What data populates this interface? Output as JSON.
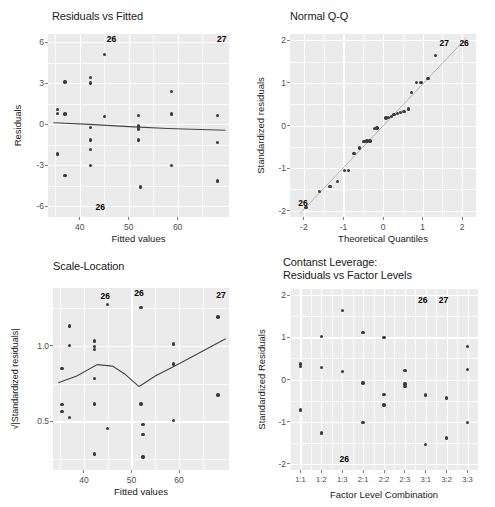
{
  "figure": {
    "background_color": "#ffffff",
    "panel_fill": "#ebebeb",
    "grid_color": "#ffffff",
    "point_color": "#3a3a3a",
    "width": 495,
    "height": 507
  },
  "chart_data": [
    {
      "id": "residuals-vs-fitted",
      "type": "scatter",
      "title": "Residuals vs Fitted",
      "xlabel": "Fitted values",
      "ylabel": "Residuals",
      "xlim": [
        33.5,
        70.5
      ],
      "ylim": [
        -6.8,
        6.6
      ],
      "xticks": [
        40,
        50,
        60
      ],
      "xtick_labels": [
        "40",
        "50",
        "60"
      ],
      "yticks": [
        -6,
        -3,
        0,
        3,
        6
      ],
      "ytick_labels": [
        "-6",
        "-3",
        "0",
        "3",
        "6"
      ],
      "grid": true,
      "legend": "none",
      "points": [
        {
          "x": 35.4,
          "y": 1.05
        },
        {
          "x": 35.4,
          "y": 0.8
        },
        {
          "x": 35.4,
          "y": -2.2
        },
        {
          "x": 37.0,
          "y": 3.1
        },
        {
          "x": 37.0,
          "y": 0.75
        },
        {
          "x": 37.0,
          "y": -3.75
        },
        {
          "x": 42.2,
          "y": 3.4
        },
        {
          "x": 42.2,
          "y": 3.0
        },
        {
          "x": 42.2,
          "y": -0.25
        },
        {
          "x": 42.2,
          "y": -1.15
        },
        {
          "x": 42.2,
          "y": -1.85
        },
        {
          "x": 42.2,
          "y": -3.05
        },
        {
          "x": 45.0,
          "y": 5.1
        },
        {
          "x": 45.0,
          "y": 0.55
        },
        {
          "x": 52.0,
          "y": 0.65
        },
        {
          "x": 52.0,
          "y": -0.15
        },
        {
          "x": 52.0,
          "y": -0.35
        },
        {
          "x": 52.0,
          "y": -1.15
        },
        {
          "x": 52.4,
          "y": -4.6
        },
        {
          "x": 58.8,
          "y": 2.4
        },
        {
          "x": 58.8,
          "y": 0.75
        },
        {
          "x": 58.8,
          "y": -3.05
        },
        {
          "x": 68.2,
          "y": 0.65
        },
        {
          "x": 68.2,
          "y": -1.35
        },
        {
          "x": 68.2,
          "y": -4.15
        }
      ],
      "trend": {
        "kind": "loess",
        "points": [
          {
            "x": 34.6,
            "y": 0.1
          },
          {
            "x": 42.0,
            "y": -0.02
          },
          {
            "x": 50.0,
            "y": -0.18
          },
          {
            "x": 58.0,
            "y": -0.32
          },
          {
            "x": 69.8,
            "y": -0.45
          }
        ]
      },
      "annotations": [
        {
          "label": "26",
          "x": 46.5,
          "y": 6.25
        },
        {
          "label": "27",
          "x": 69.0,
          "y": 6.25
        },
        {
          "label": "26",
          "x": 44.2,
          "y": -6.1
        }
      ]
    },
    {
      "id": "normal-qq",
      "type": "scatter",
      "title": "Normal Q-Q",
      "xlabel": "Theoretical Quantiles",
      "ylabel": "Standardized residuals",
      "xlim": [
        -2.35,
        2.35
      ],
      "ylim": [
        -2.15,
        2.15
      ],
      "xticks": [
        -2,
        -1,
        0,
        1,
        2
      ],
      "xtick_labels": [
        "-2",
        "-1",
        "0",
        "1",
        "2"
      ],
      "yticks": [
        -2,
        -1,
        0,
        1,
        2
      ],
      "ytick_labels": [
        "-2",
        "-1",
        "0",
        "1",
        "2"
      ],
      "grid": true,
      "legend": "none",
      "points": [
        {
          "x": -1.95,
          "y": -1.92
        },
        {
          "x": -1.6,
          "y": -1.55
        },
        {
          "x": -1.34,
          "y": -1.43
        },
        {
          "x": -1.15,
          "y": -1.31
        },
        {
          "x": -0.97,
          "y": -1.06
        },
        {
          "x": -0.87,
          "y": -1.06
        },
        {
          "x": -0.73,
          "y": -0.66
        },
        {
          "x": -0.6,
          "y": -0.53
        },
        {
          "x": -0.48,
          "y": -0.38
        },
        {
          "x": -0.4,
          "y": -0.36
        },
        {
          "x": -0.33,
          "y": -0.36
        },
        {
          "x": -0.22,
          "y": -0.07
        },
        {
          "x": -0.15,
          "y": -0.06
        },
        {
          "x": 0.08,
          "y": 0.18
        },
        {
          "x": 0.14,
          "y": 0.19
        },
        {
          "x": 0.21,
          "y": 0.21
        },
        {
          "x": 0.28,
          "y": 0.26
        },
        {
          "x": 0.36,
          "y": 0.28
        },
        {
          "x": 0.44,
          "y": 0.31
        },
        {
          "x": 0.53,
          "y": 0.33
        },
        {
          "x": 0.64,
          "y": 0.39
        },
        {
          "x": 0.72,
          "y": 0.78
        },
        {
          "x": 0.84,
          "y": 1.01
        },
        {
          "x": 0.96,
          "y": 1.01
        },
        {
          "x": 1.14,
          "y": 1.1
        },
        {
          "x": 1.33,
          "y": 1.65
        }
      ],
      "trend": {
        "kind": "qq-reference",
        "points": [
          {
            "x": -2.1,
            "y": -2.07
          },
          {
            "x": 2.1,
            "y": 2.05
          }
        ]
      },
      "annotations": [
        {
          "label": "26",
          "x": -2.02,
          "y": -1.82
        },
        {
          "label": "27",
          "x": 1.55,
          "y": 1.93
        },
        {
          "label": "26",
          "x": 2.05,
          "y": 1.95
        }
      ]
    },
    {
      "id": "scale-location",
      "type": "scatter",
      "title": "Scale-Location",
      "xlabel": "Fitted values",
      "ylabel": "√|Standardized residuals|",
      "xlim": [
        33.5,
        70.5
      ],
      "ylim": [
        0.18,
        1.38
      ],
      "xticks": [
        40,
        50,
        60
      ],
      "xtick_labels": [
        "40",
        "50",
        "60"
      ],
      "yticks": [
        0.5,
        1.0
      ],
      "ytick_labels": [
        "0.5",
        "1.0"
      ],
      "grid": true,
      "legend": "none",
      "points": [
        {
          "x": 35.4,
          "y": 0.85
        },
        {
          "x": 35.4,
          "y": 0.61
        },
        {
          "x": 35.4,
          "y": 0.565
        },
        {
          "x": 37.0,
          "y": 1.13
        },
        {
          "x": 37.0,
          "y": 1.0
        },
        {
          "x": 37.0,
          "y": 0.525
        },
        {
          "x": 42.2,
          "y": 1.03
        },
        {
          "x": 42.2,
          "y": 0.995
        },
        {
          "x": 42.2,
          "y": 0.975
        },
        {
          "x": 42.2,
          "y": 0.785
        },
        {
          "x": 42.2,
          "y": 0.615
        },
        {
          "x": 42.2,
          "y": 0.285
        },
        {
          "x": 45.0,
          "y": 1.27
        },
        {
          "x": 45.0,
          "y": 0.455
        },
        {
          "x": 52.0,
          "y": 1.25
        },
        {
          "x": 52.0,
          "y": 0.615
        },
        {
          "x": 52.4,
          "y": 0.48
        },
        {
          "x": 52.4,
          "y": 0.415
        },
        {
          "x": 52.4,
          "y": 0.265
        },
        {
          "x": 58.8,
          "y": 1.01
        },
        {
          "x": 58.8,
          "y": 0.88
        },
        {
          "x": 58.8,
          "y": 0.505
        },
        {
          "x": 68.2,
          "y": 1.19
        },
        {
          "x": 68.2,
          "y": 0.675
        }
      ],
      "trend": {
        "kind": "loess",
        "points": [
          {
            "x": 34.6,
            "y": 0.755
          },
          {
            "x": 38.5,
            "y": 0.8
          },
          {
            "x": 42.8,
            "y": 0.875
          },
          {
            "x": 46.0,
            "y": 0.865
          },
          {
            "x": 48.5,
            "y": 0.815
          },
          {
            "x": 51.6,
            "y": 0.73
          },
          {
            "x": 55.0,
            "y": 0.8
          },
          {
            "x": 60.0,
            "y": 0.88
          },
          {
            "x": 65.0,
            "y": 0.965
          },
          {
            "x": 69.8,
            "y": 1.045
          }
        ]
      },
      "annotations": [
        {
          "label": "26",
          "x": 44.5,
          "y": 1.33
        },
        {
          "label": "26",
          "x": 51.6,
          "y": 1.345
        },
        {
          "label": "27",
          "x": 68.8,
          "y": 1.335
        }
      ]
    },
    {
      "id": "constant-leverage",
      "type": "scatter",
      "title": "Contanst Leverage:\nResiduals vs Factor Levels",
      "xlabel": "Factor Level Combination",
      "ylabel": "Standardized Residuals",
      "categories": [
        "1:1",
        "1:2",
        "1:3",
        "2:1",
        "2:2",
        "2:3",
        "3:1",
        "3:2",
        "3:3"
      ],
      "ylim": [
        -2.15,
        2.15
      ],
      "yticks": [
        -2,
        -1,
        0,
        1,
        2
      ],
      "ytick_labels": [
        "-2",
        "-1",
        "0",
        "1",
        "2"
      ],
      "grid": true,
      "legend": "none",
      "points": [
        {
          "cat": 0,
          "y": 0.37
        },
        {
          "cat": 0,
          "y": 0.31
        },
        {
          "cat": 0,
          "y": -0.72
        },
        {
          "cat": 1,
          "y": 1.02
        },
        {
          "cat": 1,
          "y": 0.29
        },
        {
          "cat": 1,
          "y": -1.27
        },
        {
          "cat": 2,
          "y": 1.64
        },
        {
          "cat": 2,
          "y": 0.19
        },
        {
          "cat": 3,
          "y": 1.11
        },
        {
          "cat": 3,
          "y": -0.08
        },
        {
          "cat": 3,
          "y": -1.02
        },
        {
          "cat": 4,
          "y": 1.0
        },
        {
          "cat": 4,
          "y": -0.36
        },
        {
          "cat": 4,
          "y": -0.61
        },
        {
          "cat": 5,
          "y": 0.22
        },
        {
          "cat": 5,
          "y": -0.11
        },
        {
          "cat": 5,
          "y": -0.17
        },
        {
          "cat": 6,
          "y": -0.37
        },
        {
          "cat": 6,
          "y": -1.54
        },
        {
          "cat": 7,
          "y": -0.44
        },
        {
          "cat": 7,
          "y": -1.39
        },
        {
          "cat": 8,
          "y": 0.79
        },
        {
          "cat": 8,
          "y": 0.24
        },
        {
          "cat": 8,
          "y": -1.02
        }
      ],
      "annotations": [
        {
          "label": "26",
          "cat": 5.85,
          "y": 1.9
        },
        {
          "label": "27",
          "cat": 6.85,
          "y": 1.9
        },
        {
          "label": "26",
          "cat": 2.1,
          "y": -1.88
        }
      ]
    }
  ]
}
